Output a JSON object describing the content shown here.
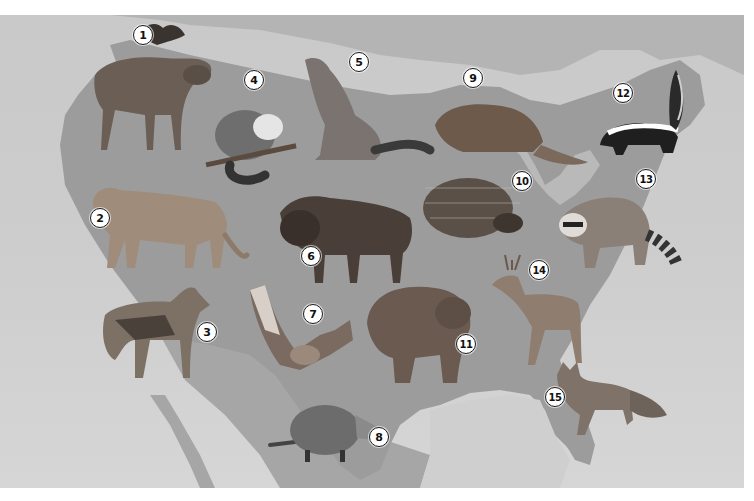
{
  "figure": {
    "type": "illustrated-map",
    "background_colors": {
      "land": "#9a9a9a",
      "water": "#cfcfcf",
      "neighbor_land": "#b5b5b5"
    }
  },
  "animals": [
    {
      "number": "1",
      "name": "moose",
      "label_x": 143,
      "label_y": 35
    },
    {
      "number": "2",
      "name": "cougar",
      "label_x": 100,
      "label_y": 218
    },
    {
      "number": "3",
      "name": "coyote",
      "label_x": 207,
      "label_y": 332
    },
    {
      "number": "4",
      "name": "opossum",
      "label_x": 254,
      "label_y": 80
    },
    {
      "number": "5",
      "name": "wolf",
      "label_x": 359,
      "label_y": 62
    },
    {
      "number": "6",
      "name": "bison",
      "label_x": 311,
      "label_y": 256
    },
    {
      "number": "7",
      "name": "bat",
      "label_x": 313,
      "label_y": 314
    },
    {
      "number": "8",
      "name": "armadillo",
      "label_x": 379,
      "label_y": 437
    },
    {
      "number": "9",
      "name": "beaver",
      "label_x": 473,
      "label_y": 78
    },
    {
      "number": "10",
      "name": "porcupine",
      "label_x": 522,
      "label_y": 181
    },
    {
      "number": "11",
      "name": "bear",
      "label_x": 466,
      "label_y": 344
    },
    {
      "number": "12",
      "name": "skunk",
      "label_x": 623,
      "label_y": 93
    },
    {
      "number": "13",
      "name": "raccoon",
      "label_x": 646,
      "label_y": 179
    },
    {
      "number": "14",
      "name": "deer",
      "label_x": 539,
      "label_y": 270
    },
    {
      "number": "15",
      "name": "fox",
      "label_x": 555,
      "label_y": 397
    }
  ]
}
